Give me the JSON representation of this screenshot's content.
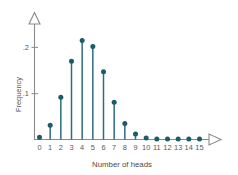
{
  "chart_data": {
    "type": "scatter",
    "title": "",
    "subtitle": "",
    "xlabel": "Number of heads",
    "ylabel": "Frequency",
    "categories": [
      "0",
      "1",
      "2",
      "3",
      "4",
      "5",
      "6",
      "7",
      "8",
      "9",
      "10",
      "11",
      "12",
      "13",
      "14",
      "15"
    ],
    "x": [
      0,
      1,
      2,
      3,
      4,
      5,
      6,
      7,
      8,
      9,
      10,
      11,
      12,
      13,
      14,
      15
    ],
    "values": [
      0.005,
      0.031,
      0.092,
      0.17,
      0.215,
      0.202,
      0.147,
      0.081,
      0.035,
      0.012,
      0.003,
      0.001,
      0.0,
      0.0,
      0.0,
      0.0
    ],
    "series": [
      {
        "name": "Frequency",
        "values": [
          0.005,
          0.031,
          0.092,
          0.17,
          0.215,
          0.202,
          0.147,
          0.081,
          0.035,
          0.012,
          0.003,
          0.001,
          0.0,
          0.0,
          0.0,
          0.0
        ]
      }
    ],
    "xlim": [
      0,
      15
    ],
    "ylim": [
      0,
      0.235
    ],
    "ytick_values": [
      0.1,
      0.2
    ],
    "ytick_labels": [
      ".1",
      ".2"
    ],
    "xtick_labels": [
      "0",
      "1",
      "2",
      "3",
      "4",
      "5",
      "6",
      "7",
      "8",
      "9",
      "10",
      "11",
      "12",
      "13",
      "14",
      "15"
    ],
    "grid": false,
    "legend": null,
    "marker": "circle",
    "stem_plot": true,
    "axis_arrows": true,
    "colors": {
      "marker": "#1c5c68",
      "stem": "#2b6e7c",
      "axis": "#8a8a8a",
      "text": "#58585a",
      "background": "#ffffff"
    }
  }
}
